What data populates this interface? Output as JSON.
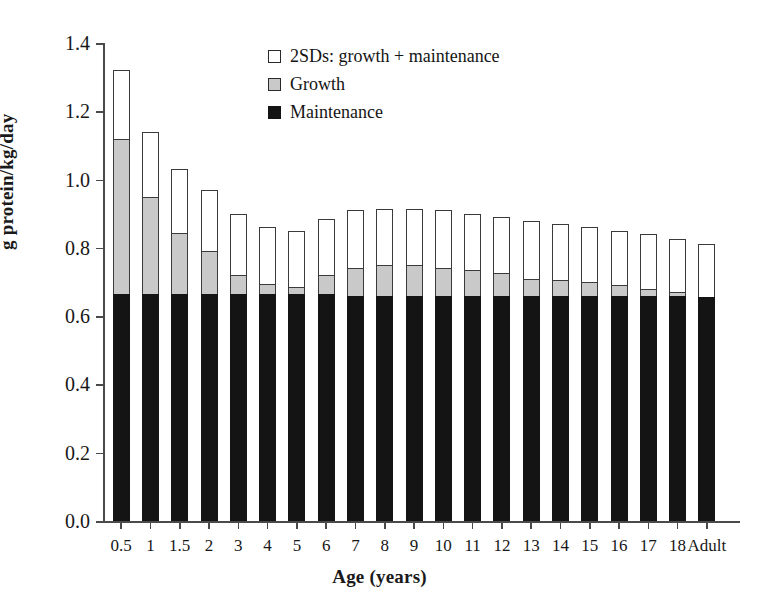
{
  "chart_data": {
    "type": "bar",
    "stacked": true,
    "title": "",
    "xlabel": "Age (years)",
    "ylabel": "g protein/kg/day",
    "ylim": [
      0.0,
      1.4
    ],
    "yticks": [
      "0.0",
      "0.2",
      "0.4",
      "0.6",
      "0.8",
      "1.0",
      "1.2",
      "1.4"
    ],
    "ytick_values": [
      0.0,
      0.2,
      0.4,
      0.6,
      0.8,
      1.0,
      1.2,
      1.4
    ],
    "grid": false,
    "legend_position": "top-center",
    "categories": [
      "0.5",
      "1",
      "1.5",
      "2",
      "3",
      "4",
      "5",
      "6",
      "7",
      "8",
      "9",
      "10",
      "11",
      "12",
      "13",
      "14",
      "15",
      "16",
      "17",
      "18",
      "Adult"
    ],
    "series": [
      {
        "name": "Maintenance",
        "color": "#141414",
        "values": [
          0.665,
          0.665,
          0.665,
          0.665,
          0.665,
          0.665,
          0.665,
          0.665,
          0.66,
          0.66,
          0.66,
          0.66,
          0.66,
          0.66,
          0.66,
          0.66,
          0.66,
          0.66,
          0.66,
          0.66,
          0.655
        ]
      },
      {
        "name": "Growth",
        "color": "#c9c9c9",
        "values": [
          0.455,
          0.285,
          0.18,
          0.125,
          0.055,
          0.03,
          0.02,
          0.055,
          0.08,
          0.09,
          0.09,
          0.08,
          0.075,
          0.065,
          0.05,
          0.045,
          0.04,
          0.03,
          0.02,
          0.01,
          0.0
        ]
      },
      {
        "name": "2SDs: growth + maintenance",
        "color": "#ffffff",
        "values": [
          0.2,
          0.19,
          0.185,
          0.18,
          0.18,
          0.165,
          0.165,
          0.165,
          0.17,
          0.165,
          0.165,
          0.17,
          0.165,
          0.165,
          0.17,
          0.165,
          0.16,
          0.16,
          0.16,
          0.155,
          0.155
        ]
      }
    ],
    "totals": [
      1.32,
      1.14,
      1.03,
      0.97,
      0.9,
      0.86,
      0.85,
      0.885,
      0.91,
      0.915,
      0.915,
      0.91,
      0.9,
      0.89,
      0.88,
      0.87,
      0.86,
      0.85,
      0.84,
      0.825,
      0.81
    ],
    "growth_plus_maintenance": [
      1.12,
      0.95,
      0.845,
      0.79,
      0.72,
      0.695,
      0.685,
      0.72,
      0.74,
      0.75,
      0.75,
      0.74,
      0.735,
      0.725,
      0.71,
      0.705,
      0.7,
      0.69,
      0.68,
      0.67,
      0.655
    ]
  },
  "legend": {
    "items": [
      {
        "label": "2SDs: growth + maintenance",
        "swatch": "sw-total"
      },
      {
        "label": "Growth",
        "swatch": "sw-growth"
      },
      {
        "label": "Maintenance",
        "swatch": "sw-maint"
      }
    ]
  },
  "axes": {
    "x_title": "Age (years)",
    "y_title": "g protein/kg/day"
  },
  "colors": {
    "maintenance": "#141414",
    "growth": "#c9c9c9",
    "two_sds": "#ffffff",
    "axis": "#4a4a4a",
    "outline": "#3a3a3a"
  }
}
